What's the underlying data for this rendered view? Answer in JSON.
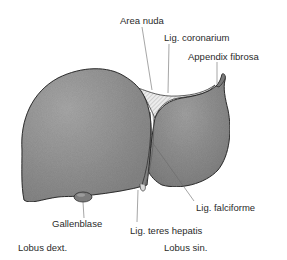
{
  "diagram": {
    "colors": {
      "organ_fill": "#8e8e8e",
      "organ_highlight": "#a8a8a8",
      "outline": "#3a3a3a",
      "bare_area_fill": "#e6e6e6",
      "leader_line": "#6a6a6a",
      "text": "#2a2a2a"
    },
    "labels": {
      "area_nuda": "Area nuda",
      "lig_coronarium": "Lig. coronarium",
      "appendix_fibrosa": "Appendix fibrosa",
      "lig_falciforme": "Lig. falciforme",
      "gallenblase": "Gallenblase",
      "lig_teres_hepatis": "Lig. teres hepatis",
      "lobus_dext": "Lobus dext.",
      "lobus_sin": "Lobus sin."
    }
  }
}
